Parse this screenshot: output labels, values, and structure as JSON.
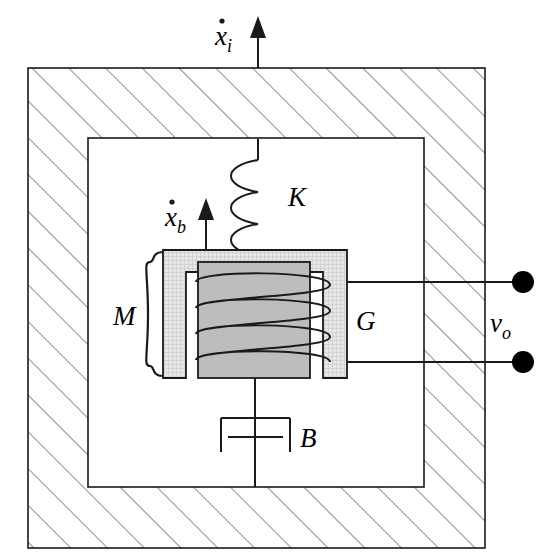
{
  "diagram": {
    "labels": {
      "input_velocity": {
        "name": "x-dot-i",
        "base": "x",
        "accent": "dot",
        "subscript": "i",
        "meaning": "case input velocity"
      },
      "body_velocity": {
        "name": "x-dot-b",
        "base": "x",
        "accent": "dot",
        "subscript": "b",
        "meaning": "seismic mass velocity"
      },
      "spring": {
        "name": "K",
        "text": "K",
        "meaning": "spring stiffness"
      },
      "damper": {
        "name": "B",
        "text": "B",
        "meaning": "viscous damping coefficient"
      },
      "mass": {
        "name": "M",
        "text": "M",
        "meaning": "seismic mass"
      },
      "coil": {
        "name": "G",
        "text": "G",
        "meaning": "coil / transduction constant"
      },
      "output_voltage": {
        "base": "v",
        "subscript": "o",
        "meaning": "output voltage terminals"
      }
    },
    "colors": {
      "stroke": "#1a1a1a",
      "hatch": "#555555",
      "magnet_fill": "#e2e2e2",
      "core_fill": "#bdbdbd",
      "terminal": "#000000",
      "background": "#ffffff"
    },
    "components": [
      {
        "name": "outer-case",
        "type": "hatched-frame",
        "note": "fixed housing with 45 degree hatching"
      },
      {
        "name": "inner-cavity",
        "type": "rectangle",
        "note": "open interior of case"
      },
      {
        "name": "spring",
        "type": "helical-spring",
        "coils": 4
      },
      {
        "name": "magnet-assembly",
        "type": "c-shaped-body",
        "note": "seismic mass M"
      },
      {
        "name": "core",
        "type": "filled-rectangle",
        "note": "inner pole piece"
      },
      {
        "name": "coil-winding",
        "type": "helix",
        "turns": 4
      },
      {
        "name": "dashpot",
        "type": "damper-symbol"
      },
      {
        "name": "output-leads",
        "type": "wires",
        "count": 2
      },
      {
        "name": "terminals",
        "type": "filled-circles",
        "count": 2
      }
    ]
  }
}
